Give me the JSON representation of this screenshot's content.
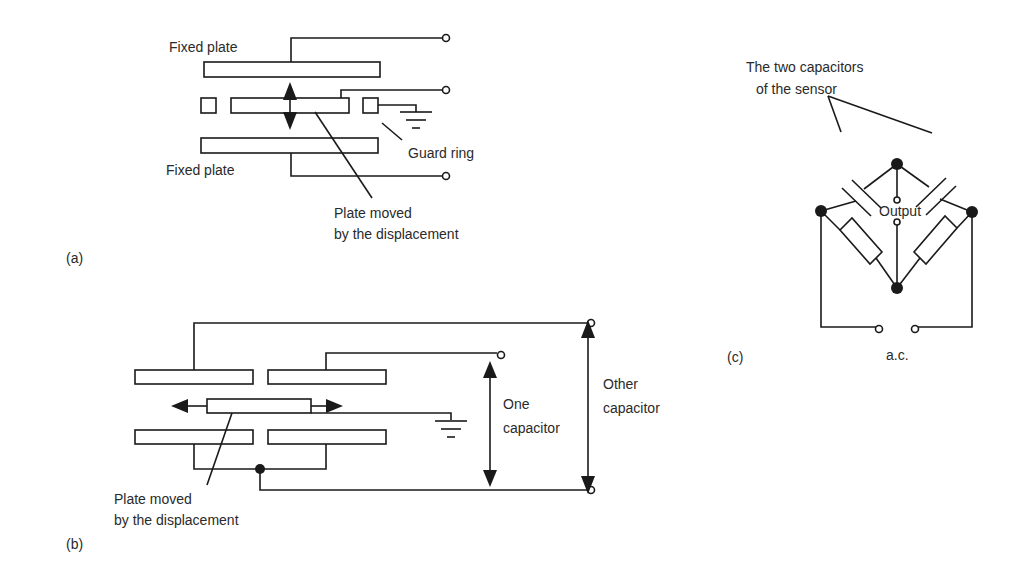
{
  "figure": {
    "panels": {
      "a": {
        "label": "(a)",
        "fixed_plate_top": "Fixed plate",
        "fixed_plate_bottom": "Fixed plate",
        "guard_ring": "Guard ring",
        "moving_plate_line1": "Plate moved",
        "moving_plate_line2": "by the displacement"
      },
      "b": {
        "label": "(b)",
        "moving_plate_line1": "Plate moved",
        "moving_plate_line2": "by the displacement",
        "one_capacitor_line1": "One",
        "one_capacitor_line2": "capacitor",
        "other_capacitor_line1": "Other",
        "other_capacitor_line2": "capacitor"
      },
      "c": {
        "label": "(c)",
        "sensor_caps_line1": "The two capacitors",
        "sensor_caps_line2": "of the sensor",
        "output": "Output",
        "supply": "a.c."
      }
    },
    "colors": {
      "line": "#1a1a1a",
      "text": "#2a2a2a",
      "background": "#ffffff"
    }
  }
}
